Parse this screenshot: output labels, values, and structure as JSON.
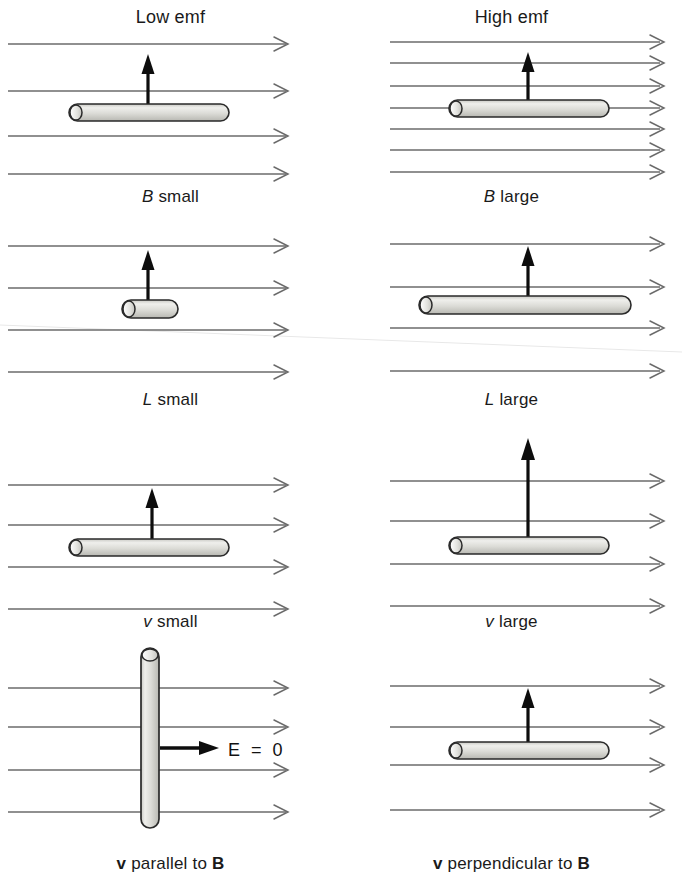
{
  "figure": {
    "title_left": "Low emf",
    "title_right": "High emf",
    "rows": [
      {
        "id": "row-b-field",
        "left": {
          "label": "B small",
          "var": "B",
          "qualifier": "small",
          "field_lines": 4,
          "rod_length_px": 160,
          "rod_orientation": "horizontal",
          "arrow_length_px": 55,
          "arrow_direction": "up"
        },
        "right": {
          "label": "B large",
          "var": "B",
          "qualifier": "large",
          "field_lines": 7,
          "rod_length_px": 160,
          "rod_orientation": "horizontal",
          "arrow_length_px": 55,
          "arrow_direction": "up"
        }
      },
      {
        "id": "row-length",
        "left": {
          "label": "L small",
          "var": "L",
          "qualifier": "small",
          "field_lines": 4,
          "rod_length_px": 56,
          "rod_orientation": "horizontal",
          "arrow_length_px": 55,
          "arrow_direction": "up"
        },
        "right": {
          "label": "L large",
          "var": "L",
          "qualifier": "large",
          "field_lines": 4,
          "rod_length_px": 212,
          "rod_orientation": "horizontal",
          "arrow_length_px": 55,
          "arrow_direction": "up"
        }
      },
      {
        "id": "row-velocity",
        "left": {
          "label": "v small",
          "var": "v",
          "qualifier": "small",
          "field_lines": 4,
          "rod_length_px": 160,
          "rod_orientation": "horizontal",
          "arrow_length_px": 50,
          "arrow_direction": "up"
        },
        "right": {
          "label": "v large",
          "var": "v",
          "qualifier": "large",
          "field_lines": 4,
          "rod_length_px": 160,
          "rod_orientation": "horizontal",
          "arrow_length_px": 112,
          "arrow_direction": "up"
        }
      },
      {
        "id": "row-orientation",
        "left": {
          "label": "v parallel to B",
          "vector_first": "v",
          "middle_text": " parallel to ",
          "vector_second": "B",
          "field_lines": 4,
          "rod_orientation": "vertical",
          "rod_length_px": 180,
          "arrow_direction": "right",
          "arrow_length_px": 60,
          "annotation": "E = 0"
        },
        "right": {
          "label": "v perpendicular to B",
          "vector_first": "v",
          "middle_text": " perpendicular to ",
          "vector_second": "B",
          "field_lines": 4,
          "rod_orientation": "horizontal",
          "rod_length_px": 160,
          "arrow_direction": "up",
          "arrow_length_px": 55
        }
      }
    ],
    "annotation_e_zero": "E = 0",
    "colors": {
      "field_line": "#6b6b6b",
      "rod_fill_light": "#f0f0ee",
      "rod_fill_mid": "#d0d0cc",
      "rod_outline": "#2a2a2a",
      "velocity_arrow": "#0d0d0d",
      "text": "#1a1a1a",
      "background": "#ffffff"
    }
  }
}
